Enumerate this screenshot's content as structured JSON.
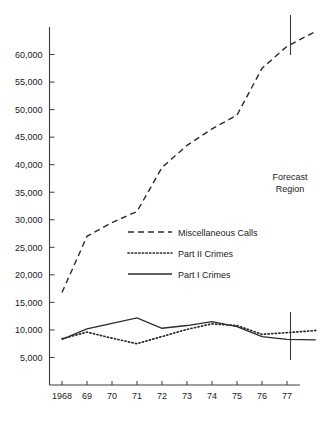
{
  "chart_data": {
    "type": "line",
    "title": "",
    "xlabel": "",
    "ylabel": "",
    "x": [
      1968,
      1969,
      1970,
      1971,
      1972,
      1973,
      1974,
      1975,
      1976,
      1977
    ],
    "categories": [
      "1968",
      "69",
      "70",
      "71",
      "72",
      "73",
      "74",
      "75",
      "76",
      "77"
    ],
    "xlim": [
      1967.5,
      1978.2
    ],
    "ylim": [
      0,
      65000
    ],
    "ytick_values": [
      5000,
      10000,
      15000,
      20000,
      25000,
      30000,
      35000,
      40000,
      45000,
      50000,
      55000,
      60000
    ],
    "ytick_labels": [
      "5,000",
      "10,000",
      "15,000",
      "20,000",
      "25,000",
      "30,000",
      "35,000",
      "40,000",
      "45,000",
      "50,000",
      "55,000",
      "60,000"
    ],
    "grid": false,
    "legend_position": "center",
    "series": [
      {
        "name": "Miscellaneous Calls",
        "style": "dashed",
        "values": [
          16800,
          27000,
          29500,
          31500,
          39500,
          43500,
          46500,
          49000,
          57500,
          61500
        ],
        "forecast_extension": {
          "x": [
            1977,
            1978.15
          ],
          "values": [
            61500,
            64200
          ]
        }
      },
      {
        "name": "Part II Crimes",
        "style": "dotted",
        "values": [
          8400,
          9600,
          8500,
          7500,
          8800,
          10100,
          11100,
          10800,
          9200,
          9500
        ],
        "forecast_extension": {
          "x": [
            1977,
            1978.15
          ],
          "values": [
            9500,
            9900
          ]
        }
      },
      {
        "name": "Part I Crimes",
        "style": "solid",
        "values": [
          8300,
          10200,
          11200,
          12200,
          10300,
          10800,
          11500,
          10600,
          8800,
          8300
        ],
        "forecast_extension": {
          "x": [
            1977,
            1978.15
          ],
          "values": [
            8300,
            8200
          ]
        }
      }
    ],
    "annotations": [
      {
        "name": "forecast-region",
        "text_line_1": "Forecast",
        "text_line_2": "Region",
        "x": 1977,
        "marker_type": "vertical-ticks"
      }
    ]
  },
  "legend": {
    "entries": [
      {
        "label": "Miscellaneous Calls",
        "style": "dashed"
      },
      {
        "label": "Part II Crimes",
        "style": "dotted"
      },
      {
        "label": "Part I Crimes",
        "style": "solid"
      }
    ]
  },
  "annotation_text": {
    "forecast_line_1": "Forecast",
    "forecast_line_2": "Region"
  }
}
